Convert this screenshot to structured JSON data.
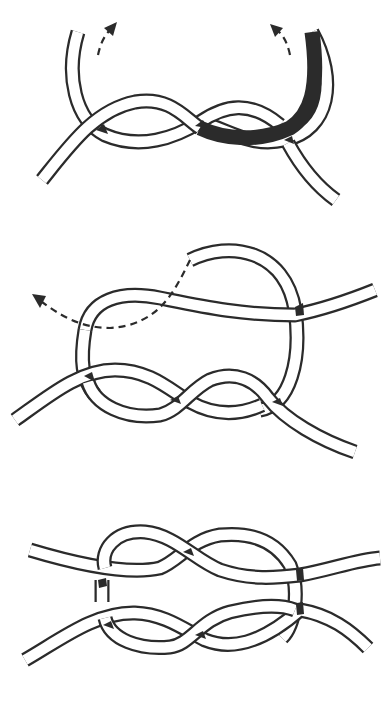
{
  "diagram": {
    "subject": "Carrick bend tying sequence",
    "background": "#ffffff",
    "line_color": "#2b2b2b",
    "steps": [
      {
        "index": 1,
        "label": "Step 1",
        "description": "Figure-eight cross of two rope ends with both working ends curving upward",
        "arrows": [
          "dashed arrow up-right (left end)",
          "dashed arrow up-left (right end)"
        ]
      },
      {
        "index": 2,
        "label": "Step 2",
        "description": "Second rope passed through the loops, working end led to the left",
        "arrows": [
          "dashed arrow pointing left"
        ]
      },
      {
        "index": 3,
        "label": "Step 3",
        "description": "Completed symmetric carrick bend with four rope ends",
        "arrows": []
      }
    ]
  }
}
